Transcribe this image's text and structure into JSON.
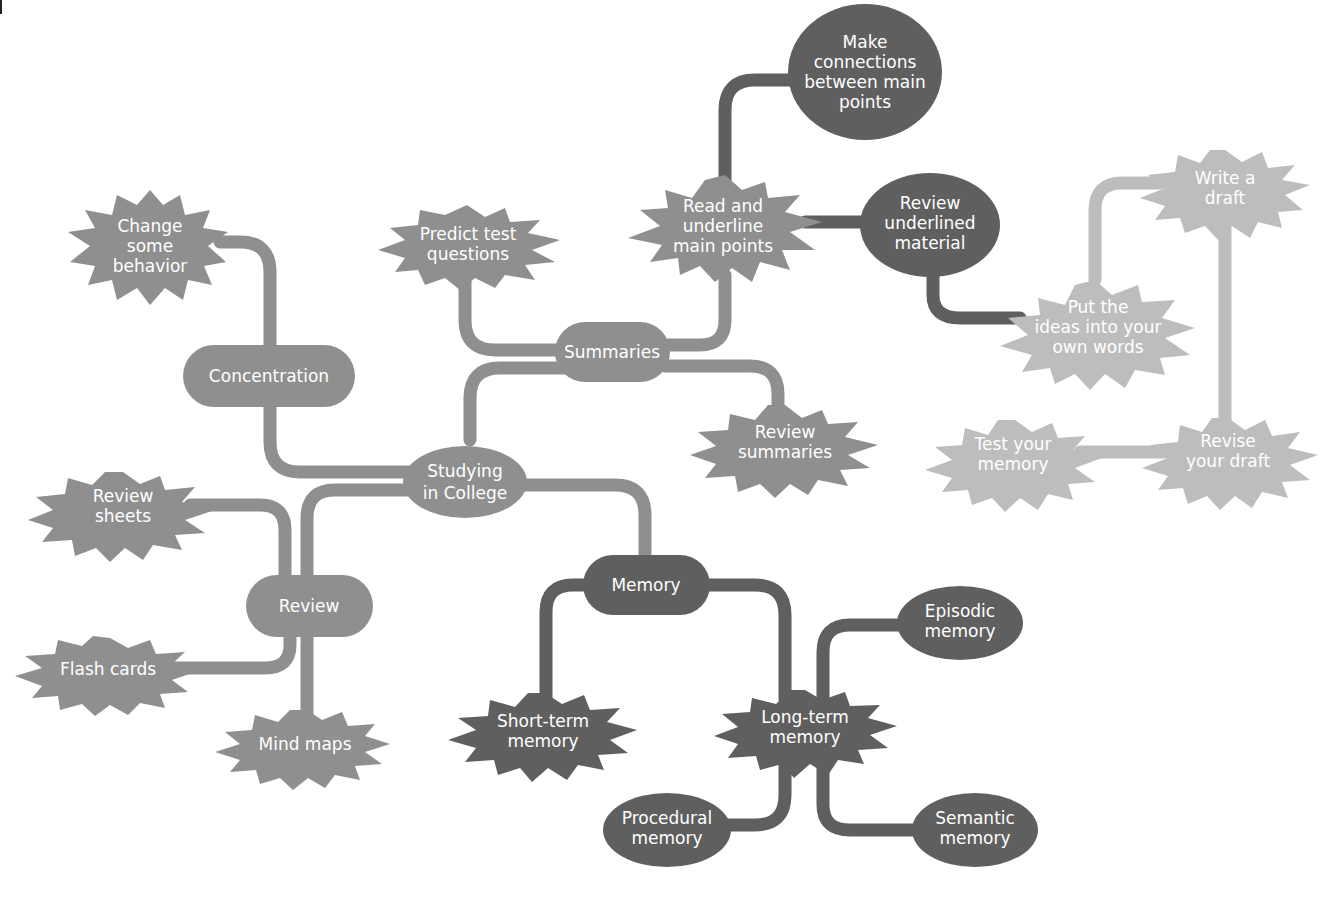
{
  "diagram": {
    "type": "mind-map",
    "colors": {
      "mid_gray": "#8f8f8f",
      "dark_gray": "#5f5f5f",
      "light_gray": "#bdbdbd",
      "text": "#ffffff",
      "background": "#ffffff"
    },
    "center": {
      "id": "center",
      "lines": [
        "Studying",
        "in College"
      ],
      "shape": "ellipse"
    },
    "nodes": {
      "concentration": {
        "lines": [
          "Concentration"
        ],
        "shape": "pill"
      },
      "change_behavior": {
        "lines": [
          "Change",
          "some",
          "behavior"
        ],
        "shape": "burst"
      },
      "summaries": {
        "lines": [
          "Summaries"
        ],
        "shape": "pill"
      },
      "predict_test": {
        "lines": [
          "Predict test",
          "questions"
        ],
        "shape": "burst"
      },
      "read_underline": {
        "lines": [
          "Read and",
          "underline",
          "main points"
        ],
        "shape": "burst"
      },
      "make_connections": {
        "lines": [
          "Make",
          "connections",
          "between main",
          "points"
        ],
        "shape": "ellipse"
      },
      "review_underlined": {
        "lines": [
          "Review",
          "underlined",
          "material"
        ],
        "shape": "ellipse"
      },
      "put_ideas": {
        "lines": [
          "Put the",
          "ideas into your",
          "own words"
        ],
        "shape": "burst"
      },
      "write_draft": {
        "lines": [
          "Write a",
          "draft"
        ],
        "shape": "burst"
      },
      "revise_draft": {
        "lines": [
          "Revise",
          "your draft"
        ],
        "shape": "burst"
      },
      "test_memory": {
        "lines": [
          "Test your",
          "memory"
        ],
        "shape": "burst"
      },
      "review_summaries": {
        "lines": [
          "Review",
          "summaries"
        ],
        "shape": "burst"
      },
      "review": {
        "lines": [
          "Review"
        ],
        "shape": "pill"
      },
      "review_sheets": {
        "lines": [
          "Review",
          "sheets"
        ],
        "shape": "burst"
      },
      "flash_cards": {
        "lines": [
          "Flash cards"
        ],
        "shape": "burst"
      },
      "mind_maps": {
        "lines": [
          "Mind maps"
        ],
        "shape": "burst"
      },
      "memory": {
        "lines": [
          "Memory"
        ],
        "shape": "pill"
      },
      "short_term": {
        "lines": [
          "Short-term",
          "memory"
        ],
        "shape": "burst"
      },
      "long_term": {
        "lines": [
          "Long-term",
          "memory"
        ],
        "shape": "burst"
      },
      "episodic": {
        "lines": [
          "Episodic",
          "memory"
        ],
        "shape": "ellipse"
      },
      "procedural": {
        "lines": [
          "Procedural",
          "memory"
        ],
        "shape": "ellipse"
      },
      "semantic": {
        "lines": [
          "Semantic",
          "memory"
        ],
        "shape": "ellipse"
      }
    },
    "edges": [
      [
        "center",
        "concentration"
      ],
      [
        "concentration",
        "change_behavior"
      ],
      [
        "center",
        "summaries"
      ],
      [
        "summaries",
        "predict_test"
      ],
      [
        "summaries",
        "read_underline"
      ],
      [
        "summaries",
        "review_summaries"
      ],
      [
        "read_underline",
        "make_connections"
      ],
      [
        "read_underline",
        "review_underlined"
      ],
      [
        "review_underlined",
        "put_ideas"
      ],
      [
        "put_ideas",
        "write_draft"
      ],
      [
        "write_draft",
        "revise_draft"
      ],
      [
        "revise_draft",
        "test_memory"
      ],
      [
        "center",
        "review"
      ],
      [
        "review",
        "review_sheets"
      ],
      [
        "review",
        "flash_cards"
      ],
      [
        "review",
        "mind_maps"
      ],
      [
        "center",
        "memory"
      ],
      [
        "memory",
        "short_term"
      ],
      [
        "memory",
        "long_term"
      ],
      [
        "long_term",
        "episodic"
      ],
      [
        "long_term",
        "procedural"
      ],
      [
        "long_term",
        "semantic"
      ]
    ]
  }
}
